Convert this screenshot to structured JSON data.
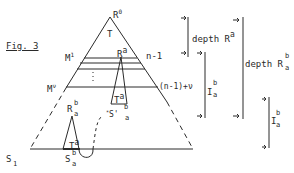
{
  "figure": {
    "caption": "Fig. 3",
    "root": {
      "base": "R",
      "sup": "0"
    },
    "tree": "T",
    "node_ra": {
      "base": "R",
      "sup": "a"
    },
    "level_m1": {
      "base": "M",
      "sup": "1"
    },
    "level_mv": {
      "base": "M",
      "sup": "ν"
    },
    "label_n_minus_1": "n-1",
    "label_n_minus_1_plus_v": "(n-1)+ν",
    "subtree_ta": {
      "base": "T",
      "sup": "a"
    },
    "node_s_prime": {
      "prefix": "*",
      "base": "S'",
      "sup": "b",
      "sub": "a"
    },
    "node_rab": {
      "base": "R",
      "sup": "b",
      "sub": "a"
    },
    "subtree_ta_lower": {
      "base": "T",
      "sup": "a"
    },
    "node_sab": {
      "base": "S",
      "sup": "b",
      "sub": "a"
    },
    "node_s1": {
      "base": "S",
      "sub": "1"
    }
  },
  "brackets": {
    "depth_ra": {
      "text": "depth R",
      "sup": "a"
    },
    "interval_iab_upper": {
      "base": "I",
      "sup": "b",
      "sub": "a"
    },
    "depth_rab": {
      "text": "depth R",
      "sup": "b",
      "sub": "a"
    },
    "interval_iab_lower": {
      "base": "I",
      "sup": "b",
      "sub": "a"
    }
  },
  "colors": {
    "ink": "#2a2a2a",
    "background": "#ffffff"
  }
}
